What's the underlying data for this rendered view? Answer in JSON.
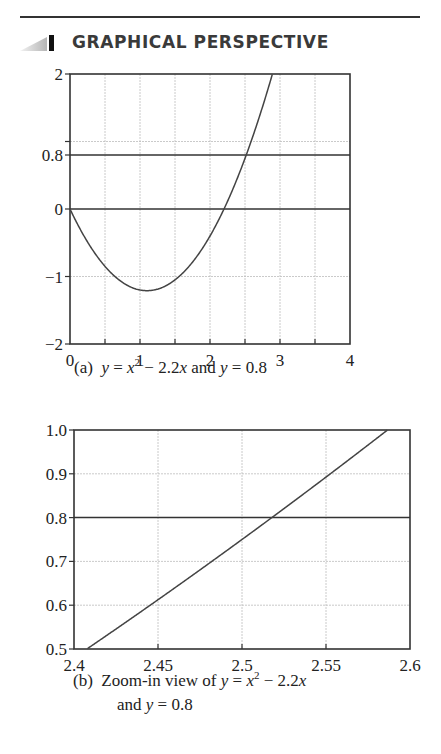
{
  "header": {
    "section_title": "GRAPHICAL PERSPECTIVE"
  },
  "chart_data": [
    {
      "type": "line",
      "title": "",
      "caption": "(a)  y = x² − 2.2x and y = 0.8",
      "caption_parts": {
        "label": "(a)",
        "text": "y = x² − 2.2x and y = 0.8"
      },
      "xlabel": "",
      "ylabel": "",
      "xlim": [
        0,
        4
      ],
      "ylim": [
        -2,
        2
      ],
      "x_ticks": [
        "0",
        "1",
        "2",
        "3",
        "4"
      ],
      "y_ticks": [
        "2",
        "0.8",
        "0",
        "−1",
        "−2"
      ],
      "y_tick_values": [
        2,
        0.8,
        0,
        -1,
        -2
      ],
      "x_gridlines": [
        0.5,
        1,
        1.5,
        2,
        2.5,
        3,
        3.5
      ],
      "y_gridlines": [
        1,
        -1
      ],
      "grid": true,
      "series": [
        {
          "name": "y = x^2 - 2.2x",
          "function": "x^2 - 2.2x",
          "x": [
            0,
            0.25,
            0.5,
            0.75,
            1.0,
            1.1,
            1.25,
            1.5,
            1.75,
            2.0,
            2.2,
            2.25,
            2.5,
            2.75,
            2.89
          ],
          "y": [
            0,
            -0.49,
            -0.85,
            -1.09,
            -1.2,
            -1.21,
            -1.19,
            -1.05,
            -0.79,
            -0.4,
            0,
            0.11,
            0.75,
            1.51,
            2.0
          ]
        },
        {
          "name": "y = 0.8",
          "function": "0.8",
          "x": [
            0,
            4
          ],
          "y": [
            0.8,
            0.8
          ]
        },
        {
          "name": "y = 0",
          "function": "0",
          "x": [
            0,
            4
          ],
          "y": [
            0,
            0
          ]
        }
      ]
    },
    {
      "type": "line",
      "title": "",
      "caption": "(b)  Zoom-in view of y = x² − 2.2x and y = 0.8",
      "caption_parts": {
        "label": "(b)",
        "line1": "Zoom-in view of y = x² − 2.2x",
        "line2": "and y = 0.8"
      },
      "xlabel": "",
      "ylabel": "",
      "xlim": [
        2.4,
        2.6
      ],
      "ylim": [
        0.5,
        1.0
      ],
      "x_ticks": [
        "2.4",
        "2.45",
        "2.5",
        "2.55",
        "2.6"
      ],
      "y_ticks": [
        "1.0",
        "0.9",
        "0.8",
        "0.7",
        "0.6",
        "0.5"
      ],
      "x_gridlines": [
        2.45,
        2.5,
        2.55
      ],
      "y_gridlines": [
        0.9,
        0.7,
        0.6
      ],
      "grid": true,
      "series": [
        {
          "name": "y = x^2 - 2.2x",
          "function": "x^2 - 2.2x",
          "x": [
            2.4077,
            2.45,
            2.5,
            2.5165,
            2.55,
            2.5866
          ],
          "y": [
            0.5,
            0.6125,
            0.75,
            0.8,
            0.8925,
            1.0
          ]
        },
        {
          "name": "y = 0.8",
          "function": "0.8",
          "x": [
            2.4,
            2.6
          ],
          "y": [
            0.8,
            0.8
          ]
        }
      ],
      "intersection": {
        "x": 2.5165,
        "y": 0.8
      }
    }
  ]
}
